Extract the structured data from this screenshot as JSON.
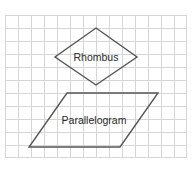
{
  "figure": {
    "background_color": "#ffffff",
    "grid": {
      "line_color": "#d6d6d6",
      "cell_size_px": 13,
      "columns": 14,
      "rows": 11,
      "left_px": 5,
      "top_px": 15,
      "width_px": 182,
      "height_px": 143
    },
    "stroke_color": "#555555",
    "stroke_width_px": 1.4,
    "text_color": "#2a2a2a"
  },
  "shapes": [
    {
      "name": "rhombus",
      "label": "Rhombus",
      "type": "polygon",
      "fill": "none",
      "points": "96,28 137,57 96,85 55,57",
      "vertices": [
        {
          "x": 96,
          "y": 28
        },
        {
          "x": 137,
          "y": 57
        },
        {
          "x": 96,
          "y": 85
        },
        {
          "x": 55,
          "y": 57
        }
      ]
    },
    {
      "name": "parallelogram",
      "label": "Parallelogram",
      "type": "polygon",
      "fill": "none",
      "points": "67,93 158,93 120,147 29,147",
      "vertices": [
        {
          "x": 67,
          "y": 93
        },
        {
          "x": 158,
          "y": 93
        },
        {
          "x": 120,
          "y": 147
        },
        {
          "x": 29,
          "y": 147
        }
      ]
    }
  ]
}
